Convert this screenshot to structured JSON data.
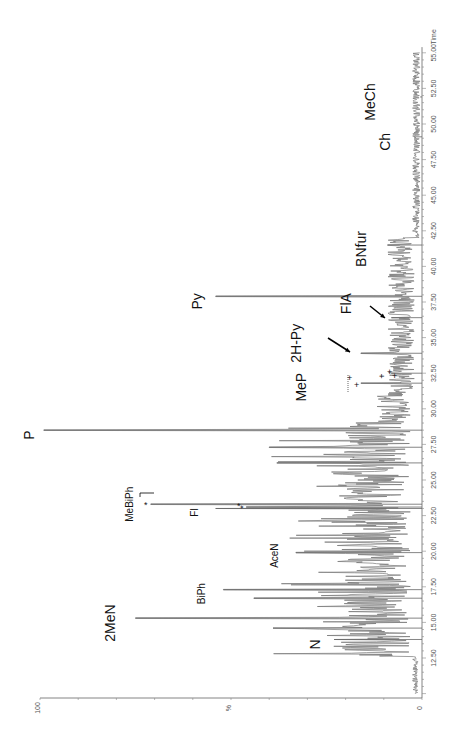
{
  "chart_data": {
    "type": "line",
    "title": "",
    "orientation": "rotated-90-ccw",
    "xlabel": "Time",
    "ylabel": "%",
    "xlim": [
      10.0,
      55.0
    ],
    "ylim": [
      0,
      100
    ],
    "x_ticks": [
      "12.50",
      "15.00",
      "17.50",
      "20.00",
      "22.50",
      "25.00",
      "27.50",
      "30.00",
      "32.50",
      "35.00",
      "37.50",
      "40.00",
      "42.50",
      "45.00",
      "47.50",
      "50.00",
      "52.50",
      "55.00"
    ],
    "y_ticks": [
      "0",
      "%",
      "100"
    ],
    "grid": false,
    "legend": null,
    "peaks": [
      {
        "label": "N",
        "time": 13.8,
        "intensity": 23,
        "font": 14
      },
      {
        "label": "",
        "time": 14.6,
        "intensity": 39,
        "font": 0
      },
      {
        "label": "2MeN",
        "time": 15.3,
        "intensity": 75,
        "font": 14
      },
      {
        "label": "",
        "time": 16.7,
        "intensity": 44,
        "font": 0
      },
      {
        "label": "BiPh",
        "time": 17.3,
        "intensity": 52,
        "font": 10
      },
      {
        "label": "AceN",
        "time": 19.9,
        "intensity": 33,
        "font": 10
      },
      {
        "label": "Fl",
        "time": 23.0,
        "intensity": 54,
        "font": 10
      },
      {
        "label": "*",
        "time": 23.1,
        "intensity": 46,
        "font": 9
      },
      {
        "label": "MeBiPh",
        "time": 23.3,
        "intensity": 71,
        "font": 10
      },
      {
        "label": "",
        "time": 26.2,
        "intensity": 38,
        "font": 0
      },
      {
        "label": "",
        "time": 27.3,
        "intensity": 40,
        "font": 0
      },
      {
        "label": "P",
        "time": 28.5,
        "intensity": 99,
        "font": 14
      },
      {
        "label": "MeP",
        "time": 31.8,
        "intensity": 16,
        "font": 14
      },
      {
        "label": "+",
        "time": 32.5,
        "intensity": 8,
        "font": 9
      },
      {
        "label": "2H-Py",
        "time": 33.9,
        "intensity": 16,
        "font": 14
      },
      {
        "label": "FlA",
        "time": 36.4,
        "intensity": 8,
        "font": 14
      },
      {
        "label": "Py",
        "time": 37.9,
        "intensity": 54,
        "font": 14
      },
      {
        "label": "BNfur",
        "time": 41.5,
        "intensity": 9,
        "font": 14
      },
      {
        "label": "Ch",
        "time": 49.1,
        "intensity": 2,
        "font": 14
      },
      {
        "label": "MeCh",
        "time": 51.9,
        "intensity": 0.5,
        "font": 14
      }
    ]
  },
  "axis": {
    "y_top_label": "100",
    "y_mid_label": "%",
    "y_zero_label": "0",
    "time_label": "Time"
  }
}
